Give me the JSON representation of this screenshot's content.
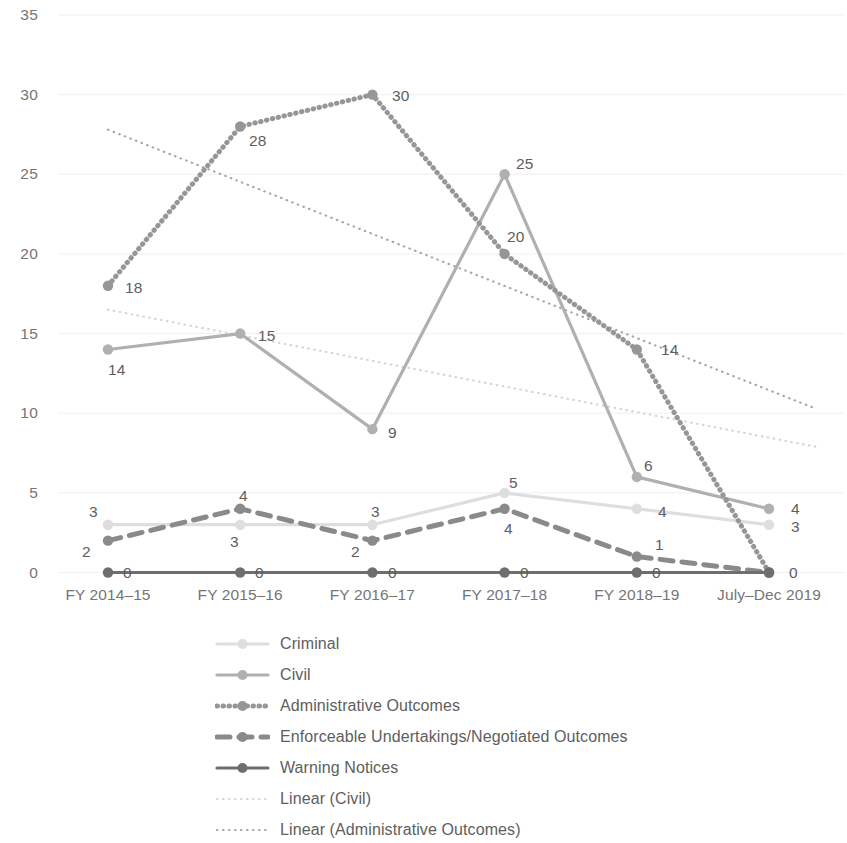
{
  "chart_data": {
    "type": "line",
    "title": "",
    "xlabel": "",
    "ylabel": "",
    "ylim": [
      0,
      35
    ],
    "yticks": [
      0,
      5,
      10,
      15,
      20,
      25,
      30,
      35
    ],
    "grid": true,
    "legend_position": "bottom",
    "categories": [
      "FY 2014–15",
      "FY 2015–16",
      "FY 2016–17",
      "FY 2017–18",
      "FY 2018–19",
      "July–Dec 2019"
    ],
    "series": [
      {
        "name": "Criminal",
        "values": [
          3,
          3,
          3,
          5,
          4,
          3
        ],
        "color": "#dedede",
        "style": "solid",
        "marker": "circle"
      },
      {
        "name": "Civil",
        "values": [
          14,
          15,
          9,
          25,
          6,
          4
        ],
        "color": "#b0b0b0",
        "style": "solid",
        "marker": "circle"
      },
      {
        "name": "Administrative Outcomes",
        "values": [
          18,
          28,
          30,
          20,
          14,
          0
        ],
        "color": "#969696",
        "style": "dotted",
        "marker": "circle"
      },
      {
        "name": "Enforceable Undertakings/Negotiated Outcomes",
        "values": [
          2,
          4,
          2,
          4,
          1,
          0
        ],
        "color": "#8a8a8a",
        "style": "dashed",
        "marker": "circle"
      },
      {
        "name": "Warning Notices",
        "values": [
          0,
          0,
          0,
          0,
          0,
          0
        ],
        "color": "#6e6e6e",
        "style": "solid",
        "marker": "circle"
      }
    ],
    "trendlines": [
      {
        "name": "Linear (Civil)",
        "color": "#d5d5d5",
        "style": "dotted",
        "start": {
          "x": 0,
          "y": 16.5
        },
        "end": {
          "x": 5.35,
          "y": 7.9
        }
      },
      {
        "name": "Linear (Administrative Outcomes)",
        "color": "#a8a8a8",
        "style": "dotted",
        "start": {
          "x": 0,
          "y": 27.8
        },
        "end": {
          "x": 5.35,
          "y": 10.3
        }
      }
    ],
    "point_labels": [
      {
        "series": "Administrative Outcomes",
        "category": "FY 2014–15",
        "text": "18"
      },
      {
        "series": "Administrative Outcomes",
        "category": "FY 2015–16",
        "text": "28"
      },
      {
        "series": "Administrative Outcomes",
        "category": "FY 2016–17",
        "text": "30"
      },
      {
        "series": "Administrative Outcomes",
        "category": "FY 2017–18",
        "text": "20"
      },
      {
        "series": "Administrative Outcomes",
        "category": "FY 2018–19",
        "text": "14"
      },
      {
        "series": "Civil",
        "category": "FY 2014–15",
        "text": "14"
      },
      {
        "series": "Civil",
        "category": "FY 2015–16",
        "text": "15"
      },
      {
        "series": "Civil",
        "category": "FY 2016–17",
        "text": "9"
      },
      {
        "series": "Civil",
        "category": "FY 2017–18",
        "text": "25"
      },
      {
        "series": "Civil",
        "category": "FY 2018–19",
        "text": "6"
      },
      {
        "series": "Civil",
        "category": "July–Dec 2019",
        "text": "4"
      },
      {
        "series": "Criminal",
        "category": "FY 2014–15",
        "text": "3"
      },
      {
        "series": "Criminal",
        "category": "FY 2015–16",
        "text": "3"
      },
      {
        "series": "Criminal",
        "category": "FY 2016–17",
        "text": "3"
      },
      {
        "series": "Criminal",
        "category": "FY 2017–18",
        "text": "5"
      },
      {
        "series": "Criminal",
        "category": "FY 2018–19",
        "text": "4"
      },
      {
        "series": "Criminal",
        "category": "July–Dec 2019",
        "text": "3"
      },
      {
        "series": "Enforceable Undertakings/Negotiated Outcomes",
        "category": "FY 2014–15",
        "text": "2"
      },
      {
        "series": "Enforceable Undertakings/Negotiated Outcomes",
        "category": "FY 2015–16",
        "text": "4"
      },
      {
        "series": "Enforceable Undertakings/Negotiated Outcomes",
        "category": "FY 2016–17",
        "text": "2"
      },
      {
        "series": "Enforceable Undertakings/Negotiated Outcomes",
        "category": "FY 2017–18",
        "text": "4"
      },
      {
        "series": "Enforceable Undertakings/Negotiated Outcomes",
        "category": "FY 2018–19",
        "text": "1"
      },
      {
        "series": "Warning Notices",
        "category": "FY 2014–15",
        "text": "0"
      },
      {
        "series": "Warning Notices",
        "category": "FY 2015–16",
        "text": "0"
      },
      {
        "series": "Warning Notices",
        "category": "FY 2016–17",
        "text": "0"
      },
      {
        "series": "Warning Notices",
        "category": "FY 2017–18",
        "text": "0"
      },
      {
        "series": "Warning Notices",
        "category": "FY 2018–19",
        "text": "0"
      },
      {
        "series": "Warning Notices",
        "category": "July–Dec 2019",
        "text": "0"
      }
    ],
    "legend": [
      "Criminal",
      "Civil",
      "Administrative Outcomes",
      "Enforceable Undertakings/Negotiated Outcomes",
      "Warning Notices",
      "Linear (Civil)",
      "Linear (Administrative Outcomes)"
    ]
  },
  "label_positions": [
    {
      "text": "18",
      "x": 125,
      "y": 279,
      "color": "#5e5e5e"
    },
    {
      "text": "28",
      "x": 249,
      "y": 132,
      "color": "#5e5e5e"
    },
    {
      "text": "30",
      "x": 392,
      "y": 87,
      "color": "#5e5e5e"
    },
    {
      "text": "20",
      "x": 507,
      "y": 228,
      "color": "#5e5e5e"
    },
    {
      "text": "14",
      "x": 661,
      "y": 341,
      "color": "#5e5e5e"
    },
    {
      "text": "14",
      "x": 108,
      "y": 361,
      "color": "#5e5e5e"
    },
    {
      "text": "15",
      "x": 258,
      "y": 327,
      "color": "#5e5e5e"
    },
    {
      "text": "9",
      "x": 388,
      "y": 424,
      "color": "#5e5e5e"
    },
    {
      "text": "25",
      "x": 516,
      "y": 155,
      "color": "#5e5e5e"
    },
    {
      "text": "6",
      "x": 644,
      "y": 457,
      "color": "#5e5e5e"
    },
    {
      "text": "4",
      "x": 791,
      "y": 500,
      "color": "#5e5e5e"
    },
    {
      "text": "3",
      "x": 89,
      "y": 503,
      "color": "#5e5e5e"
    },
    {
      "text": "3",
      "x": 230,
      "y": 533,
      "color": "#5e5e5e"
    },
    {
      "text": "3",
      "x": 371,
      "y": 503,
      "color": "#5e5e5e"
    },
    {
      "text": "5",
      "x": 509,
      "y": 474,
      "color": "#5e5e5e"
    },
    {
      "text": "4",
      "x": 504,
      "y": 520,
      "color": "#5e5e5e"
    },
    {
      "text": "3",
      "x": 791,
      "y": 518,
      "color": "#5e5e5e"
    },
    {
      "text": "2",
      "x": 82,
      "y": 543,
      "color": "#5e5e5e"
    },
    {
      "text": "4",
      "x": 239,
      "y": 487,
      "color": "#5e5e5e"
    },
    {
      "text": "2",
      "x": 351,
      "y": 543,
      "color": "#5e5e5e"
    },
    {
      "text": "4",
      "x": 658,
      "y": 503,
      "color": "#5e5e5e"
    },
    {
      "text": "1",
      "x": 655,
      "y": 536,
      "color": "#5e5e5e"
    },
    {
      "text": "0",
      "x": 123,
      "y": 564,
      "color": "#5e5e5e"
    },
    {
      "text": "0",
      "x": 255,
      "y": 564,
      "color": "#5e5e5e"
    },
    {
      "text": "0",
      "x": 388,
      "y": 564,
      "color": "#5e5e5e"
    },
    {
      "text": "0",
      "x": 520,
      "y": 564,
      "color": "#5e5e5e"
    },
    {
      "text": "0",
      "x": 652,
      "y": 564,
      "color": "#5e5e5e"
    },
    {
      "text": "0",
      "x": 789,
      "y": 564,
      "color": "#5e5e5e"
    }
  ]
}
